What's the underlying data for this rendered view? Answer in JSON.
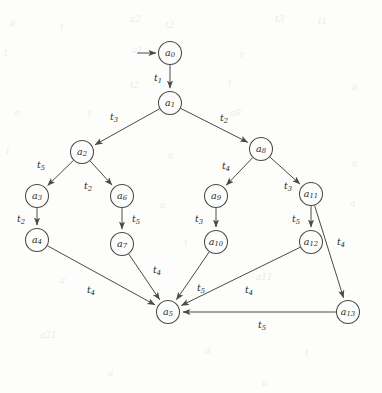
{
  "figure": {
    "kind": "state-transition-diagram",
    "title": "",
    "node_radius": 11.5,
    "colors": {
      "background": "#fdfdfb",
      "stroke": "#4a4a4a",
      "text": "#2b2b2b"
    }
  },
  "nodes": [
    {
      "id": "a0",
      "base": "a",
      "sub": "0",
      "x": 170,
      "y": 53
    },
    {
      "id": "a1",
      "base": "a",
      "sub": "1",
      "x": 170,
      "y": 103
    },
    {
      "id": "a2",
      "base": "a",
      "sub": "2",
      "x": 82,
      "y": 152
    },
    {
      "id": "a3",
      "base": "a",
      "sub": "3",
      "x": 37,
      "y": 196
    },
    {
      "id": "a4",
      "base": "a",
      "sub": "4",
      "x": 37,
      "y": 240
    },
    {
      "id": "a5",
      "base": "a",
      "sub": "5",
      "x": 168,
      "y": 312
    },
    {
      "id": "a6",
      "base": "a",
      "sub": "6",
      "x": 122,
      "y": 196
    },
    {
      "id": "a7",
      "base": "a",
      "sub": "7",
      "x": 122,
      "y": 244
    },
    {
      "id": "a8",
      "base": "a",
      "sub": "8",
      "x": 261,
      "y": 149
    },
    {
      "id": "a9",
      "base": "a",
      "sub": "9",
      "x": 216,
      "y": 196
    },
    {
      "id": "a10",
      "base": "a",
      "sub": "10",
      "x": 216,
      "y": 242
    },
    {
      "id": "a11",
      "base": "a",
      "sub": "11",
      "x": 311,
      "y": 194
    },
    {
      "id": "a12",
      "base": "a",
      "sub": "12",
      "x": 311,
      "y": 242
    },
    {
      "id": "a13",
      "base": "a",
      "sub": "13",
      "x": 348,
      "y": 312
    }
  ],
  "initial_arrow": {
    "name": "initial-state-arrow",
    "from_x": 137,
    "from_y": 53,
    "to_x": 156,
    "to_y": 53
  },
  "edges": [
    {
      "from": "a0",
      "to": "a1",
      "label_base": "t",
      "label_sub": "1",
      "lx": 158,
      "ly": 78
    },
    {
      "from": "a1",
      "to": "a2",
      "label_base": "t",
      "label_sub": "3",
      "lx": 114,
      "ly": 117
    },
    {
      "from": "a1",
      "to": "a8",
      "label_base": "t",
      "label_sub": "2",
      "lx": 224,
      "ly": 118
    },
    {
      "from": "a2",
      "to": "a3",
      "label_base": "t",
      "label_sub": "5",
      "lx": 41,
      "ly": 165
    },
    {
      "from": "a2",
      "to": "a6",
      "label_base": "t",
      "label_sub": "2",
      "lx": 88,
      "ly": 186
    },
    {
      "from": "a3",
      "to": "a4",
      "label_base": "t",
      "label_sub": "2",
      "lx": 21,
      "ly": 219
    },
    {
      "from": "a6",
      "to": "a7",
      "label_base": "t",
      "label_sub": "5",
      "lx": 136,
      "ly": 219
    },
    {
      "from": "a8",
      "to": "a9",
      "label_base": "t",
      "label_sub": "4",
      "lx": 226,
      "ly": 166
    },
    {
      "from": "a8",
      "to": "a11",
      "label_base": "t",
      "label_sub": "3",
      "lx": 288,
      "ly": 186
    },
    {
      "from": "a9",
      "to": "a10",
      "label_base": "t",
      "label_sub": "3",
      "lx": 199,
      "ly": 219
    },
    {
      "from": "a11",
      "to": "a12",
      "label_base": "t",
      "label_sub": "5",
      "lx": 296,
      "ly": 219
    },
    {
      "from": "a11",
      "to": "a13",
      "label_base": "t",
      "label_sub": "4",
      "lx": 341,
      "ly": 242
    },
    {
      "from": "a4",
      "to": "a5",
      "label_base": "t",
      "label_sub": "4",
      "lx": 91,
      "ly": 290
    },
    {
      "from": "a7",
      "to": "a5",
      "label_base": "t",
      "label_sub": "4",
      "lx": 157,
      "ly": 270
    },
    {
      "from": "a10",
      "to": "a5",
      "label_base": "t",
      "label_sub": "5",
      "lx": 201,
      "ly": 288
    },
    {
      "from": "a12",
      "to": "a5",
      "label_base": "t",
      "label_sub": "4",
      "lx": 249,
      "ly": 290
    },
    {
      "from": "a13",
      "to": "a5",
      "label_base": "t",
      "label_sub": "5",
      "lx": 262,
      "ly": 325
    }
  ],
  "background_artifacts": [
    {
      "text": "a",
      "x": 10,
      "y": 18,
      "size": 9
    },
    {
      "text": "t",
      "x": 60,
      "y": 22,
      "size": 9
    },
    {
      "text": "a2",
      "x": 130,
      "y": 14,
      "size": 9
    },
    {
      "text": "t2",
      "x": 165,
      "y": 20,
      "size": 9
    },
    {
      "text": "t3",
      "x": 275,
      "y": 14,
      "size": 9
    },
    {
      "text": "t1",
      "x": 318,
      "y": 16,
      "size": 9
    },
    {
      "text": "t",
      "x": 4,
      "y": 48,
      "size": 9
    },
    {
      "text": "a1",
      "x": 132,
      "y": 45,
      "size": 9
    },
    {
      "text": "t",
      "x": 240,
      "y": 50,
      "size": 9
    },
    {
      "text": "t2",
      "x": 130,
      "y": 80,
      "size": 9
    },
    {
      "text": "t",
      "x": 228,
      "y": 78,
      "size": 9
    },
    {
      "text": "a",
      "x": 352,
      "y": 82,
      "size": 9
    },
    {
      "text": "a",
      "x": 14,
      "y": 108,
      "size": 9
    },
    {
      "text": "t",
      "x": 88,
      "y": 108,
      "size": 9
    },
    {
      "text": "a9",
      "x": 230,
      "y": 108,
      "size": 9
    },
    {
      "text": "t",
      "x": 6,
      "y": 146,
      "size": 9
    },
    {
      "text": "a",
      "x": 168,
      "y": 150,
      "size": 9
    },
    {
      "text": "a",
      "x": 352,
      "y": 158,
      "size": 9
    },
    {
      "text": "a",
      "x": 160,
      "y": 200,
      "size": 9
    },
    {
      "text": "a",
      "x": 350,
      "y": 198,
      "size": 9
    },
    {
      "text": "t",
      "x": 184,
      "y": 238,
      "size": 9
    },
    {
      "text": "a11",
      "x": 256,
      "y": 272,
      "size": 9
    },
    {
      "text": "a",
      "x": 60,
      "y": 275,
      "size": 9
    },
    {
      "text": "a21",
      "x": 40,
      "y": 330,
      "size": 9
    },
    {
      "text": "a",
      "x": 205,
      "y": 345,
      "size": 9
    },
    {
      "text": "t",
      "x": 305,
      "y": 348,
      "size": 9
    },
    {
      "text": "a",
      "x": 108,
      "y": 368,
      "size": 9
    },
    {
      "text": "a",
      "x": 262,
      "y": 378,
      "size": 9
    }
  ]
}
